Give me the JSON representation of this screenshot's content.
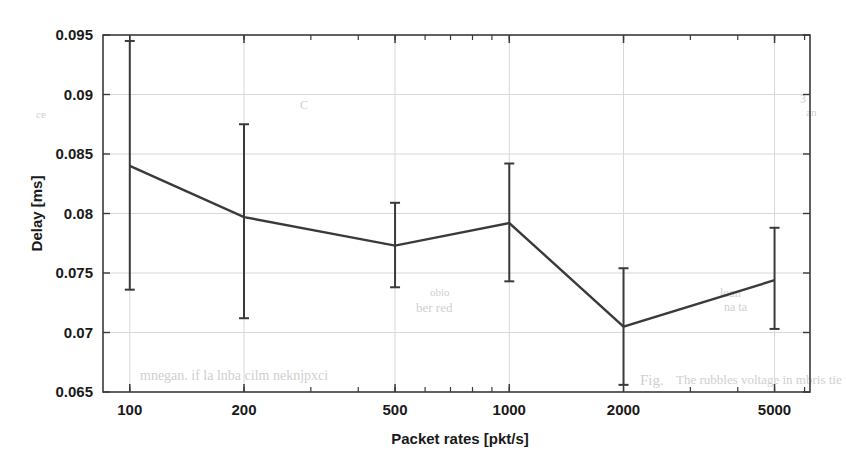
{
  "figure": {
    "background_color": "#ffffff",
    "ink_color": "#3a3a3a",
    "grid_color": "#d8d8d8"
  },
  "ghost_marks": [
    {
      "text": "ber red",
      "x": 416,
      "y": 300,
      "size": 13,
      "rotate": 0
    },
    {
      "text": "obio",
      "x": 430,
      "y": 286,
      "size": 11,
      "rotate": 0
    },
    {
      "text": "Fig.",
      "x": 640,
      "y": 372,
      "size": 15,
      "rotate": 0
    },
    {
      "text": "The rubbles voltage  in  mbris tie",
      "x": 676,
      "y": 372,
      "size": 13,
      "rotate": 0
    },
    {
      "text": "mnegan. if  la   lnba    cilm  neknjpxci",
      "x": 140,
      "y": 368,
      "size": 14,
      "rotate": 0
    },
    {
      "text": "loan",
      "x": 720,
      "y": 286,
      "size": 12,
      "rotate": 0
    },
    {
      "text": "na  ta",
      "x": 724,
      "y": 300,
      "size": 12,
      "rotate": 0
    },
    {
      "text": "C",
      "x": 300,
      "y": 98,
      "size": 12,
      "rotate": 0
    },
    {
      "text": "ce",
      "x": 36,
      "y": 108,
      "size": 11,
      "rotate": 0
    },
    {
      "text": "3",
      "x": 800,
      "y": 92,
      "size": 12,
      "rotate": 0
    },
    {
      "text": "an",
      "x": 806,
      "y": 106,
      "size": 11,
      "rotate": 0
    },
    {
      "text": "4",
      "x": 36,
      "y": 198,
      "size": 11,
      "rotate": 0
    }
  ],
  "chart_data": {
    "type": "line",
    "title": "",
    "xlabel": "Packet rates [pkt/s]",
    "ylabel": "Delay [ms]",
    "xscale": "log",
    "xlim": [
      85,
      6200
    ],
    "ylim": [
      0.065,
      0.095
    ],
    "grid": true,
    "legend": "none",
    "x_tick_labels": [
      "100",
      "200",
      "500",
      "1000",
      "2000",
      "5000"
    ],
    "x": [
      100,
      200,
      500,
      1000,
      2000,
      5000
    ],
    "y_tick_labels": [
      "0.095",
      "0.09",
      "0.085",
      "0.08",
      "0.075",
      "0.07",
      "0.065"
    ],
    "y_ticks": [
      0.095,
      0.09,
      0.085,
      0.08,
      0.075,
      0.07,
      0.065
    ],
    "series": [
      {
        "name": "Delay",
        "values": [
          0.084,
          0.0797,
          0.0773,
          0.0792,
          0.0705,
          0.0744
        ],
        "error_upper": [
          0.0945,
          0.0875,
          0.0809,
          0.0842,
          0.0754,
          0.0788
        ],
        "error_lower": [
          0.0736,
          0.0712,
          0.0738,
          0.0743,
          0.0656,
          0.0703
        ]
      }
    ]
  }
}
